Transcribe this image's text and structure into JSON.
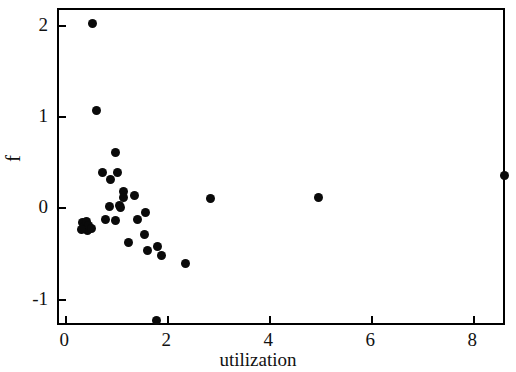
{
  "chart_data": {
    "type": "scatter",
    "title": "",
    "xlabel": "utilization",
    "ylabel": "f",
    "xlim": [
      -0.14,
      8.64
    ],
    "ylim": [
      -1.3,
      2.17
    ],
    "xticks": [
      0,
      2,
      4,
      6,
      8
    ],
    "xticklabels": [
      "0",
      "2",
      "4",
      "6",
      "8"
    ],
    "yticks": [
      -1,
      0,
      1,
      2
    ],
    "yticklabels": [
      "-1",
      "0",
      "1",
      "2"
    ],
    "grid": false,
    "legend": null,
    "marker": "circle",
    "marker_color": "#0a0a0a",
    "marker_size": 9,
    "series": [
      {
        "name": "observations",
        "points": [
          [
            0.51,
            2.02
          ],
          [
            0.59,
            1.07
          ],
          [
            0.96,
            0.61
          ],
          [
            0.71,
            0.39
          ],
          [
            0.86,
            0.31
          ],
          [
            1.01,
            0.39
          ],
          [
            1.12,
            0.18
          ],
          [
            1.13,
            0.12
          ],
          [
            1.33,
            0.14
          ],
          [
            0.84,
            0.02
          ],
          [
            1.04,
            0.03
          ],
          [
            1.07,
            0.01
          ],
          [
            0.33,
            -0.16
          ],
          [
            0.36,
            -0.2
          ],
          [
            0.4,
            -0.14
          ],
          [
            0.41,
            -0.24
          ],
          [
            0.44,
            -0.19
          ],
          [
            0.3,
            -0.23
          ],
          [
            0.49,
            -0.22
          ],
          [
            0.78,
            -0.12
          ],
          [
            0.97,
            -0.13
          ],
          [
            1.39,
            -0.12
          ],
          [
            1.55,
            -0.05
          ],
          [
            1.53,
            -0.29
          ],
          [
            1.22,
            -0.38
          ],
          [
            1.6,
            -0.46
          ],
          [
            1.8,
            -0.42
          ],
          [
            1.86,
            -0.52
          ],
          [
            2.34,
            -0.6
          ],
          [
            1.78,
            -1.23
          ],
          [
            2.82,
            0.11
          ],
          [
            4.95,
            0.12
          ],
          [
            8.6,
            0.36
          ]
        ]
      }
    ]
  },
  "axes": {
    "x_title": "utilization",
    "y_title": "f"
  }
}
